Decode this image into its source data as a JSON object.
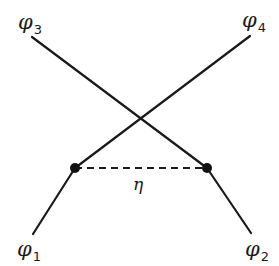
{
  "diagram": {
    "type": "feynman-like vertex diagram",
    "colors": {
      "line": "#1a1a1a",
      "background": "#ffffff"
    },
    "vertices": [
      {
        "id": "left-vertex",
        "x": 75,
        "y": 168
      },
      {
        "id": "right-vertex",
        "x": 207,
        "y": 168
      }
    ],
    "external_lines": [
      {
        "id": "phi1-line",
        "from": [
          75,
          168
        ],
        "to": [
          33,
          234
        ]
      },
      {
        "id": "phi2-line",
        "from": [
          207,
          168
        ],
        "to": [
          251,
          233
        ]
      },
      {
        "id": "phi3-line",
        "from": [
          207,
          168
        ],
        "to": [
          32,
          37
        ]
      },
      {
        "id": "phi4-line",
        "from": [
          75,
          168
        ],
        "to": [
          250,
          36
        ]
      }
    ],
    "internal_line": {
      "id": "eta-propagator",
      "style": "dashed",
      "from": [
        75,
        168
      ],
      "to": [
        207,
        168
      ]
    },
    "labels": {
      "phi1": {
        "symbol": "φ",
        "sub": "1"
      },
      "phi2": {
        "symbol": "φ",
        "sub": "2"
      },
      "phi3": {
        "symbol": "φ",
        "sub": "3"
      },
      "phi4": {
        "symbol": "φ",
        "sub": "4"
      },
      "eta": "η"
    }
  }
}
